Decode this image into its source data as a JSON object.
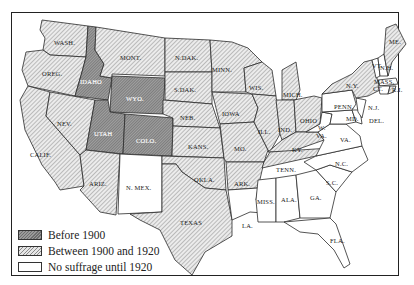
{
  "map": {
    "title": "Woman suffrage in the United States before 1920",
    "categories": {
      "before_1900": {
        "label": "Before 1900",
        "color": "#808080"
      },
      "between_1900_1920": {
        "label": "Between 1900 and 1920",
        "color": "#d8d8d8"
      },
      "none_until_1920": {
        "label": "No suffrage until 1920",
        "color": "#ffffff"
      }
    },
    "states": {
      "wash": {
        "label": "WASH.",
        "category": "between_1900_1920"
      },
      "oreg": {
        "label": "OREG.",
        "category": "between_1900_1920"
      },
      "calif": {
        "label": "CALIF.",
        "category": "between_1900_1920"
      },
      "nev": {
        "label": "NEV.",
        "category": "between_1900_1920"
      },
      "idaho": {
        "label": "IDAHO",
        "category": "before_1900"
      },
      "mont": {
        "label": "MONT.",
        "category": "between_1900_1920"
      },
      "wyo": {
        "label": "WYO.",
        "category": "before_1900"
      },
      "utah": {
        "label": "UTAH",
        "category": "before_1900"
      },
      "colo": {
        "label": "COLO.",
        "category": "before_1900"
      },
      "ariz": {
        "label": "ARIZ.",
        "category": "between_1900_1920"
      },
      "nmex": {
        "label": "N. MEX.",
        "category": "none_until_1920"
      },
      "ndak": {
        "label": "N.DAK.",
        "category": "between_1900_1920"
      },
      "sdak": {
        "label": "S.DAK.",
        "category": "between_1900_1920"
      },
      "neb": {
        "label": "NEB.",
        "category": "between_1900_1920"
      },
      "kans": {
        "label": "KANS.",
        "category": "between_1900_1920"
      },
      "okla": {
        "label": "OKLA.",
        "category": "between_1900_1920"
      },
      "texas": {
        "label": "TEXAS",
        "category": "between_1900_1920"
      },
      "minn": {
        "label": "MINN.",
        "category": "between_1900_1920"
      },
      "iowa": {
        "label": "IOWA",
        "category": "between_1900_1920"
      },
      "mo": {
        "label": "MO.",
        "category": "between_1900_1920"
      },
      "ark": {
        "label": "ARK.",
        "category": "between_1900_1920"
      },
      "la": {
        "label": "LA.",
        "category": "none_until_1920"
      },
      "wis": {
        "label": "WIS.",
        "category": "between_1900_1920"
      },
      "ill": {
        "label": "ILL.",
        "category": "between_1900_1920"
      },
      "mich": {
        "label": "MICH.",
        "category": "between_1900_1920"
      },
      "ind": {
        "label": "IND.",
        "category": "between_1900_1920"
      },
      "ohio": {
        "label": "OHIO",
        "category": "between_1900_1920"
      },
      "ky": {
        "label": "KY.",
        "category": "between_1900_1920"
      },
      "tenn": {
        "label": "TENN.",
        "category": "between_1900_1920"
      },
      "miss": {
        "label": "MISS.",
        "category": "none_until_1920"
      },
      "ala": {
        "label": "ALA.",
        "category": "none_until_1920"
      },
      "ga": {
        "label": "GA.",
        "category": "none_until_1920"
      },
      "fla": {
        "label": "FLA.",
        "category": "none_until_1920"
      },
      "sc": {
        "label": "S.C.",
        "category": "none_until_1920"
      },
      "nc": {
        "label": "N.C.",
        "category": "none_until_1920"
      },
      "va": {
        "label": "VA.",
        "category": "none_until_1920"
      },
      "wva_1": {
        "label": "W.",
        "category": "none_until_1920"
      },
      "wva_2": {
        "label": "VA.",
        "category": "none_until_1920"
      },
      "md": {
        "label": "MD.",
        "category": "none_until_1920"
      },
      "del": {
        "label": "DEL.",
        "category": "none_until_1920"
      },
      "nj": {
        "label": "N.J.",
        "category": "none_until_1920"
      },
      "penn": {
        "label": "PENN.",
        "category": "none_until_1920"
      },
      "ny": {
        "label": "N.Y.",
        "category": "between_1900_1920"
      },
      "vt": {
        "label": "VT.",
        "category": "none_until_1920"
      },
      "nh": {
        "label": "N.H.",
        "category": "none_until_1920"
      },
      "me": {
        "label": "ME.",
        "category": "between_1900_1920"
      },
      "mass": {
        "label": "MASS.",
        "category": "none_until_1920"
      },
      "ct": {
        "label": "CT.",
        "category": "none_until_1920"
      },
      "ri": {
        "label": "R.I.",
        "category": "between_1900_1920"
      }
    }
  },
  "legend": {
    "items": [
      {
        "label": "Before 1900",
        "swatch": "dark-hatch"
      },
      {
        "label": "Between 1900 and 1920",
        "swatch": "light-hatch"
      },
      {
        "label": "No suffrage until 1920",
        "swatch": "white"
      }
    ]
  }
}
